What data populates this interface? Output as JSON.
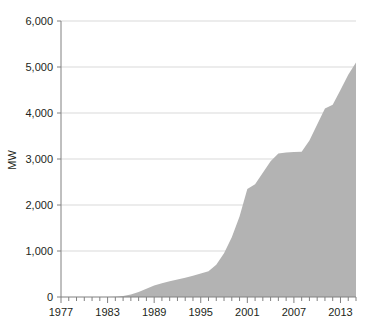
{
  "chart_data": {
    "type": "area",
    "title": "",
    "subtitle": "",
    "xlabel": "",
    "ylabel": "MW",
    "xlim": [
      1977,
      2015
    ],
    "ylim": [
      0,
      6000
    ],
    "grid": true,
    "legend": null,
    "series_name": "Installed capacity",
    "fill_color": "#b3b3b3",
    "axis_color": "#808080",
    "grid_color": "#d9d9d9",
    "text_color": "#231f20",
    "y_ticks": [
      0,
      1000,
      2000,
      3000,
      4000,
      5000,
      6000
    ],
    "y_tick_labels": [
      "0",
      "1,000",
      "2,000",
      "3,000",
      "4,000",
      "5,000",
      "6,000"
    ],
    "x_ticks": [
      1977,
      1983,
      1989,
      1995,
      2001,
      2007,
      2013
    ],
    "x_tick_labels": [
      "1977",
      "1983",
      "1989",
      "1995",
      "2001",
      "2007",
      "2013"
    ],
    "x_minor_tick_step": 1,
    "x": [
      1977,
      1978,
      1979,
      1980,
      1981,
      1982,
      1983,
      1984,
      1985,
      1986,
      1987,
      1988,
      1989,
      1990,
      1991,
      1992,
      1993,
      1994,
      1995,
      1996,
      1997,
      1998,
      1999,
      2000,
      2001,
      2002,
      2003,
      2004,
      2005,
      2006,
      2007,
      2008,
      2009,
      2010,
      2011,
      2012,
      2013,
      2014,
      2015
    ],
    "values": [
      0,
      0,
      0,
      0,
      0,
      0,
      0,
      5,
      20,
      55,
      110,
      180,
      250,
      300,
      340,
      380,
      420,
      460,
      510,
      560,
      700,
      950,
      1300,
      1750,
      2350,
      2450,
      2700,
      2950,
      3120,
      3140,
      3150,
      3160,
      3400,
      3750,
      4100,
      4180,
      4500,
      4830,
      5100
    ]
  }
}
